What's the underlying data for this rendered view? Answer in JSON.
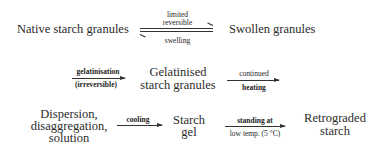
{
  "diagram": {
    "title": "",
    "type": "process-flow",
    "nodes": {
      "native": "Native starch granules",
      "swollen": "Swollen granules",
      "gelatinised_line1": "Gelatinised",
      "gelatinised_line2": "starch granules",
      "dispersion_line1": "Dispersion,",
      "dispersion_line2": "disaggregation,",
      "dispersion_line3": "solution",
      "gel_line1": "Starch",
      "gel_line2": "gel",
      "retro_line1": "Retrograded",
      "retro_line2": "starch"
    },
    "edges": {
      "native_swollen": {
        "above_line1": "limited",
        "above_line2": "reversible",
        "below": "swelling",
        "direction": "reversible"
      },
      "to_gelatinised": {
        "above": "gelatinisation",
        "below": "(irreversible)",
        "direction": "forward"
      },
      "to_dispersion": {
        "above": "continued",
        "below": "heating",
        "direction": "forward"
      },
      "to_gel": {
        "above": "cooling",
        "direction": "forward"
      },
      "to_retro": {
        "above": "standing at",
        "below": "low temp. (5 °C)",
        "direction": "forward"
      }
    }
  }
}
